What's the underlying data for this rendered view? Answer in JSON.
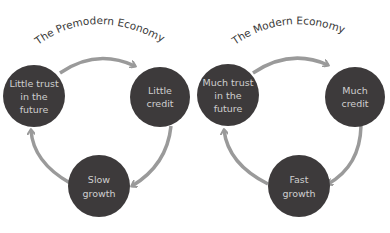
{
  "colors": {
    "node_fill": "#3d3a3b",
    "node_text": "#cfcfcf",
    "arrow": "#9a9a9a",
    "title": "#3a3a3a",
    "background": "#ffffff"
  },
  "diagrams": [
    {
      "title": "The Premodern Economy",
      "nodes": [
        {
          "lines": [
            "Little trust",
            "in the",
            "future"
          ]
        },
        {
          "lines": [
            "Little",
            "credit"
          ]
        },
        {
          "lines": [
            "Slow",
            "growth"
          ]
        }
      ]
    },
    {
      "title": "The Modern Economy",
      "nodes": [
        {
          "lines": [
            "Much trust",
            "in the",
            "future"
          ]
        },
        {
          "lines": [
            "Much",
            "credit"
          ]
        },
        {
          "lines": [
            "Fast",
            "growth"
          ]
        }
      ]
    }
  ]
}
